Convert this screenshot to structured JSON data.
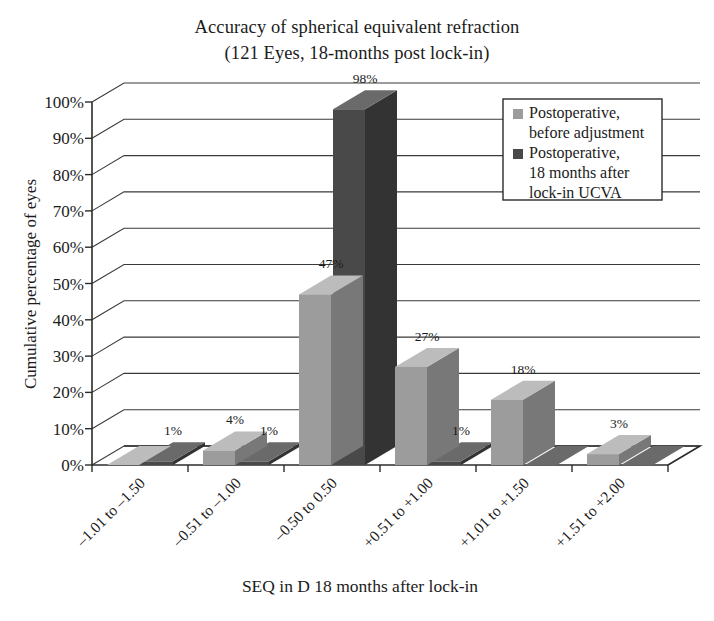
{
  "chart_data": {
    "type": "bar",
    "title": "Accuracy of spherical equivalent refraction",
    "subtitle": "(121 Eyes, 18-months post lock-in)",
    "xlabel": "SEQ in D 18 months after lock-in",
    "ylabel": "Cumulative percentage of eyes",
    "categories": [
      "–1.01 to –1.50",
      "–0.51 to –1.00",
      "–0.50 to 0.50",
      "+0.51 to +1.00",
      "+1.01 to +1.50",
      "+1.51 to +2.00"
    ],
    "series": [
      {
        "name": "Postoperative, before adjustment",
        "color": "#9c9c9c",
        "values": [
          0,
          4,
          47,
          27,
          18,
          3
        ],
        "labels": [
          "",
          "4%",
          "47%",
          "27%",
          "18%",
          "3%"
        ]
      },
      {
        "name": "Postoperative, 18 months after lock-in UCVA",
        "color": "#494949",
        "values": [
          1,
          1,
          98,
          1,
          0,
          0
        ],
        "labels": [
          "1%",
          "1%",
          "98%",
          "1%",
          "",
          ""
        ]
      }
    ],
    "ylim": [
      0,
      100
    ],
    "ytick_labels": [
      "0%",
      "10%",
      "20%",
      "30%",
      "40%",
      "50%",
      "60%",
      "70%",
      "80%",
      "90%",
      "100%"
    ],
    "ytick_values": [
      0,
      10,
      20,
      30,
      40,
      50,
      60,
      70,
      80,
      90,
      100
    ],
    "grid": true,
    "legend_position": "upper-right",
    "style": "3d-column"
  },
  "legend": {
    "entries": [
      {
        "swatch_color": "#9c9c9c",
        "lines": [
          "Postoperative,",
          "before adjustment"
        ]
      },
      {
        "swatch_color": "#494949",
        "lines": [
          "Postoperative,",
          "18 months after",
          "lock-in UCVA"
        ]
      }
    ]
  },
  "colors": {
    "series_light": "#9c9c9c",
    "series_light_top": "#bcbcbc",
    "series_light_side": "#787878",
    "series_dark": "#494949",
    "series_dark_top": "#6a6a6a",
    "series_dark_side": "#333333",
    "axis": "#2b2b2b",
    "grid": "#3a3a3a",
    "text": "#1b1b1b",
    "background": "#ffffff"
  }
}
